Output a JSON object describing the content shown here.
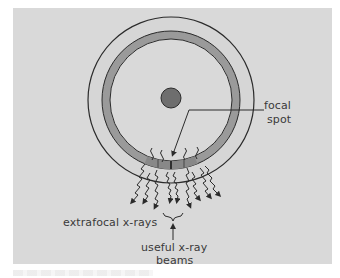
{
  "figure": {
    "background_color": "#d9d9d9",
    "anode": {
      "outer_disk_color": "#d6d6d6",
      "target_ring_color": "#9a9a9a",
      "inner_disk_color": "#d9d9d9",
      "hub_color": "#6e6e6e",
      "focal_track_segment_color": "#8a8a8a"
    },
    "labels": {
      "focal_spot_line1": "focal",
      "focal_spot_line2": "spot",
      "extrafocal": "extrafocal x-rays",
      "useful_line1": "useful x-ray",
      "useful_line2": "beams"
    }
  }
}
